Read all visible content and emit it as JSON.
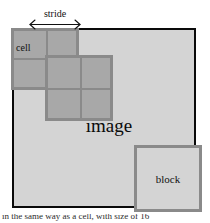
{
  "figure": {
    "type": "diagram",
    "background_color": "#ffffff"
  },
  "image_region": {
    "label": "image",
    "fill_color": "#d4d4d4",
    "border_color": "#0a0a0a"
  },
  "cells": {
    "label": "cell",
    "fill_color": "#a8a8a8",
    "border_color": "#8a8a8a",
    "grid_a": {
      "rows": 2,
      "cols": 2
    },
    "grid_b": {
      "rows": 2,
      "cols": 2
    }
  },
  "stride": {
    "label": "stride",
    "arrow": "double-headed-horizontal"
  },
  "block": {
    "label": "block",
    "fill_color": "#d4d4d4",
    "border_color": "#8a8a8a"
  },
  "caption": {
    "text": "in the same way as a cell, with size of 16"
  }
}
